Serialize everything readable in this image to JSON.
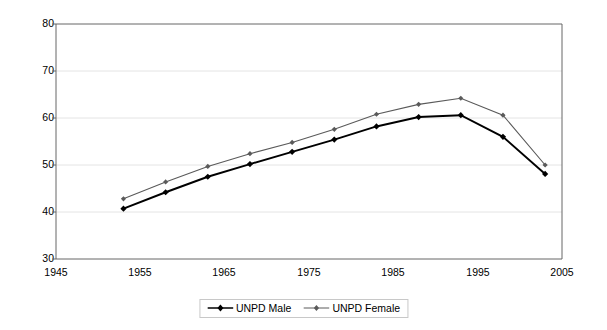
{
  "chart_data": {
    "type": "line",
    "title": "",
    "xlabel": "",
    "ylabel": "",
    "xlim": [
      1945,
      2005
    ],
    "ylim": [
      30,
      80
    ],
    "xticks": [
      1945,
      1955,
      1965,
      1975,
      1985,
      1995,
      2005
    ],
    "yticks": [
      30,
      40,
      50,
      60,
      70,
      80
    ],
    "grid": true,
    "grid_axis": "y",
    "legend_position": "bottom-center",
    "x": [
      1953,
      1958,
      1963,
      1968,
      1973,
      1978,
      1983,
      1988,
      1993,
      1998,
      2003
    ],
    "series": [
      {
        "name": "UNPD Male",
        "color": "#000000",
        "marker": "diamond",
        "values": [
          40.7,
          44.2,
          47.5,
          50.2,
          52.8,
          55.4,
          58.2,
          60.2,
          60.6,
          56.0,
          48.1
        ]
      },
      {
        "name": "UNPD Female",
        "color": "#5a5a5a",
        "marker": "diamond",
        "values": [
          42.8,
          46.4,
          49.7,
          52.4,
          54.8,
          57.6,
          60.8,
          62.9,
          64.2,
          60.6,
          50.0
        ]
      }
    ]
  },
  "axes": {
    "y_tick_labels": [
      "80",
      "70",
      "60",
      "50",
      "40",
      "30"
    ],
    "x_tick_labels": [
      "1945",
      "1955",
      "1965",
      "1975",
      "1985",
      "1995",
      "2005"
    ]
  },
  "legend": {
    "entries": [
      {
        "label": "UNPD Male"
      },
      {
        "label": "UNPD Female"
      }
    ]
  },
  "colors": {
    "male_line": "#000000",
    "female_line": "#5a5a5a",
    "axis": "#666666",
    "grid": "#e4e4e4",
    "background": "#ffffff"
  }
}
